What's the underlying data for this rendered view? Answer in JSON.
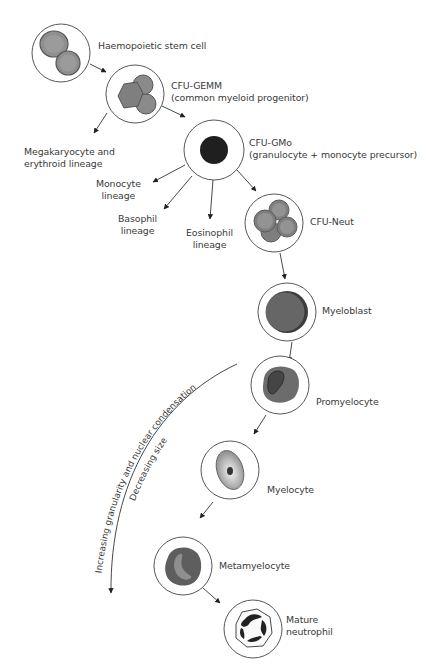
{
  "diagram": {
    "nodes": [
      {
        "id": "stem",
        "label_lines": [
          "Haemopoietic stem cell"
        ]
      },
      {
        "id": "cfu_gemm",
        "label_lines": [
          "CFU-GEMM",
          "(common myeloid progenitor)"
        ]
      },
      {
        "id": "cfu_gmo",
        "label_lines": [
          "CFU-GMo",
          "(granulocyte + monocyte precursor)"
        ]
      },
      {
        "id": "cfu_neut",
        "label_lines": [
          "CFU-Neut"
        ]
      },
      {
        "id": "myeloblast",
        "label_lines": [
          "Myeloblast"
        ]
      },
      {
        "id": "promyelocyte",
        "label_lines": [
          "Promyelocyte"
        ]
      },
      {
        "id": "myelocyte",
        "label_lines": [
          "Myelocyte"
        ]
      },
      {
        "id": "metamyelocyte",
        "label_lines": [
          "Metamyelocyte"
        ]
      },
      {
        "id": "mature_neutrophil",
        "label_lines": [
          "Mature",
          "neutrophil"
        ]
      }
    ],
    "branches": [
      {
        "id": "mega_ery",
        "label_lines": [
          "Megakaryocyte and",
          "erythroid lineage"
        ]
      },
      {
        "id": "monocyte",
        "label_lines": [
          "Monocyte",
          "lineage"
        ]
      },
      {
        "id": "basophil",
        "label_lines": [
          "Basophil",
          "lineage"
        ]
      },
      {
        "id": "eosinophil",
        "label_lines": [
          "Eosinophil",
          "lineage"
        ]
      }
    ],
    "trend_arrow": {
      "line1": "Increasing granularity and nuclear condensation",
      "line2": "Decreasing size"
    },
    "colors": {
      "outline": "#4a4a4a",
      "cell_gray": "#8a8a8a",
      "cell_dark": "#5a5a5a",
      "nucleus_black": "#222222",
      "arrow": "#333333"
    }
  }
}
